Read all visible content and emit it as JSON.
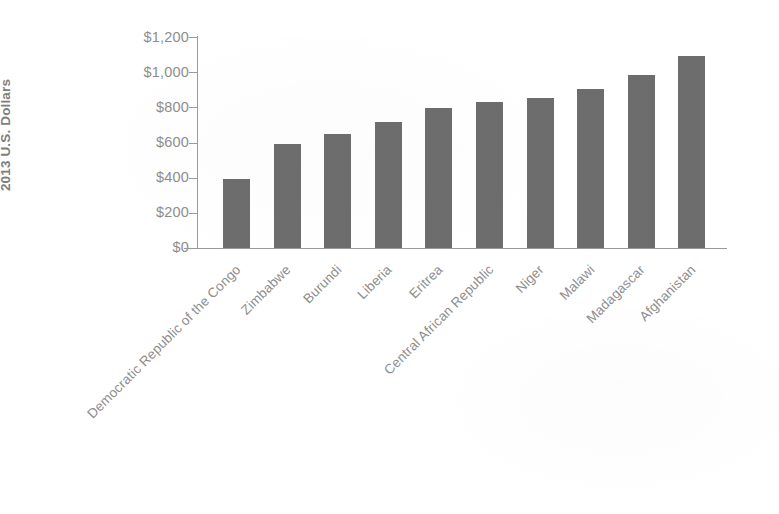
{
  "chart_data": {
    "type": "bar",
    "title": "",
    "subtitle": "",
    "xlabel": "",
    "ylabel": "2013 U.S. Dollars",
    "ylim": [
      0,
      1200
    ],
    "grid": false,
    "legend": null,
    "orientation": "vertical",
    "bar_color": "#6b6b6b",
    "background_color": "#ffffff",
    "axis_color": "#9a9a9a",
    "text_color": "#8d8d8d",
    "categories": [
      "Democratic Republic of the Congo",
      "Zimbabwe",
      "Burundi",
      "Liberia",
      "Eritrea",
      "Central African Republic",
      "Niger",
      "Malawi",
      "Madagascar",
      "Afghanistan"
    ],
    "values": [
      394,
      589,
      648,
      716,
      795,
      830,
      856,
      902,
      985,
      1090
    ],
    "ytick_values": [
      1200,
      1000,
      800,
      600,
      400,
      200,
      0
    ],
    "ytick_labels": [
      "$1,200",
      "$1,000",
      "$800",
      "$600",
      "$400",
      "$200",
      "$0"
    ],
    "xtick_rotation_degrees": -45
  }
}
